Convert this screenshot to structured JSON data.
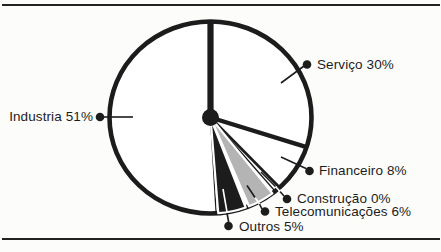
{
  "frame": {
    "background": "#fcfcfb",
    "rule_color": "#222222"
  },
  "chart_data": {
    "type": "pie",
    "title": "",
    "direction": "clockwise",
    "start_angle_deg": 0,
    "legend_position": "callouts",
    "ink": "#1c1c1c",
    "gray": "#b4b4b4",
    "slices": [
      {
        "label": "Serviço",
        "value": 30,
        "display": "Serviço 30%",
        "fill": "#ffffff"
      },
      {
        "label": "Financeiro",
        "value": 8,
        "display": "Financeiro 8%",
        "fill": "#ffffff"
      },
      {
        "label": "Construção",
        "value": 0,
        "display": "Construção 0%",
        "fill": "#ffffff"
      },
      {
        "label": "Telecomunicações",
        "value": 6,
        "display": "Telecomunicações 6%",
        "fill": "#b4b4b4"
      },
      {
        "label": "Outros",
        "value": 5,
        "display": "Outros 5%",
        "fill": "#1c1c1c"
      },
      {
        "label": "Industria",
        "value": 51,
        "display": "Industria 51%",
        "fill": "#ffffff"
      }
    ]
  }
}
